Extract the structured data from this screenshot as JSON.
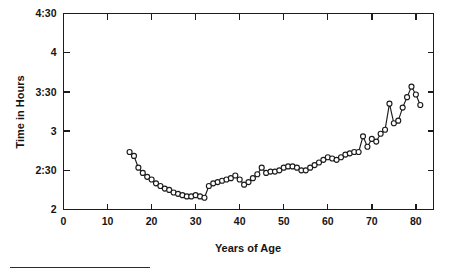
{
  "chart_data": {
    "type": "line",
    "title": "",
    "subtitle": "",
    "xlabel": "Years of Age",
    "ylabel": "Time in Hours",
    "xlim": [
      0,
      84
    ],
    "ylim": [
      120,
      270
    ],
    "grid": false,
    "legend": null,
    "markers": "open-circle",
    "y_tick_values": [
      270,
      240,
      210,
      180,
      150,
      120
    ],
    "y_tick_labels": [
      "4:30",
      "4",
      "3:30",
      "3",
      "2:30",
      "2"
    ],
    "x_tick_values": [
      0,
      10,
      20,
      30,
      40,
      50,
      60,
      70,
      80
    ],
    "x_tick_labels": [
      "0",
      "10",
      "20",
      "30",
      "40",
      "50",
      "60",
      "70",
      "80"
    ],
    "y_units": "minutes",
    "x": [
      15,
      16,
      17,
      18,
      19,
      20,
      21,
      22,
      23,
      24,
      25,
      26,
      27,
      28,
      29,
      30,
      31,
      32,
      33,
      34,
      35,
      36,
      37,
      38,
      39,
      40,
      41,
      42,
      43,
      44,
      45,
      46,
      47,
      48,
      49,
      50,
      51,
      52,
      53,
      54,
      55,
      56,
      57,
      58,
      59,
      60,
      61,
      62,
      63,
      64,
      65,
      66,
      67,
      68,
      69,
      70,
      71,
      72,
      73,
      74,
      75,
      76,
      77,
      78,
      79,
      80,
      81
    ],
    "y": [
      164,
      161,
      152,
      148,
      145,
      143,
      140,
      138,
      136,
      135,
      133,
      132,
      131,
      130,
      130,
      131,
      130,
      129,
      138,
      140,
      141,
      142,
      143,
      144,
      146,
      143,
      139,
      141,
      144,
      147,
      152,
      148,
      149,
      149,
      150,
      152,
      153,
      153,
      152,
      150,
      150,
      152,
      154,
      156,
      158,
      160,
      159,
      158,
      160,
      162,
      163,
      164,
      164,
      176,
      168,
      174,
      172,
      178,
      181,
      201,
      186,
      188,
      198,
      206,
      214,
      208,
      200
    ],
    "series": [
      {
        "name": "Average marathon finishing time",
        "values": [
          164,
          161,
          152,
          148,
          145,
          143,
          140,
          138,
          136,
          135,
          133,
          132,
          131,
          130,
          130,
          131,
          130,
          129,
          138,
          140,
          141,
          142,
          143,
          144,
          146,
          143,
          139,
          141,
          144,
          147,
          152,
          148,
          149,
          149,
          150,
          152,
          153,
          153,
          152,
          150,
          150,
          152,
          154,
          156,
          158,
          160,
          159,
          158,
          160,
          162,
          163,
          164,
          164,
          176,
          168,
          174,
          172,
          178,
          181,
          201,
          186,
          188,
          198,
          206,
          214,
          208,
          200
        ]
      }
    ]
  },
  "figure": {
    "y_axis_title": "Time in Hours",
    "x_axis_title": "Years of Age"
  }
}
